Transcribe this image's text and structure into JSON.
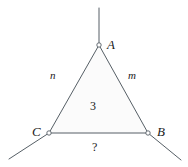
{
  "figure": {
    "type": "geometry-diagram",
    "stroke_color": "#555f66",
    "fill_color": "#fbfbfb",
    "node_fill": "#ffffff",
    "text_color": "#1a1a1a",
    "vertices": [
      {
        "id": "A",
        "label": "A",
        "x": 99,
        "y": 45
      },
      {
        "id": "B",
        "label": "B",
        "x": 148,
        "y": 133
      },
      {
        "id": "C",
        "label": "C",
        "x": 49,
        "y": 133
      }
    ],
    "edges": [
      {
        "id": "CA",
        "label": "n",
        "from": "C",
        "to": "A"
      },
      {
        "id": "AB",
        "label": "m",
        "from": "A",
        "to": "B"
      },
      {
        "id": "CB",
        "label": "?",
        "from": "C",
        "to": "B"
      }
    ],
    "interior_label": "3",
    "rays": [
      {
        "id": "ray-A",
        "from": "A",
        "x1": 99,
        "y1": 45,
        "x2": 99,
        "y2": 8
      },
      {
        "id": "ray-C",
        "from": "C",
        "x1": 49,
        "y1": 133,
        "x2": 9,
        "y2": 159
      },
      {
        "id": "ray-B",
        "from": "B",
        "x1": 148,
        "y1": 133,
        "x2": 181,
        "y2": 160
      }
    ],
    "labels": {
      "vertex_a": "A",
      "vertex_b": "B",
      "vertex_c": "C",
      "edge_left": "n",
      "edge_right": "m",
      "edge_bottom": "?",
      "interior": "3"
    }
  }
}
